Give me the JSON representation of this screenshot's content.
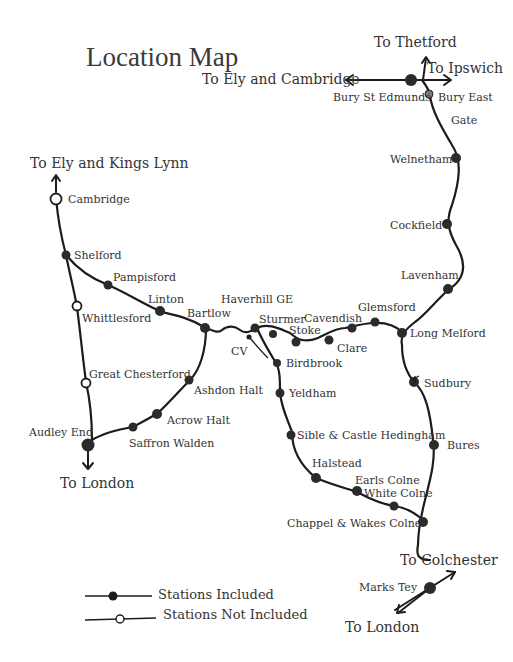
{
  "title": "Location Map",
  "colors": {
    "track": "#1c1c1c",
    "station_included": "#2b2b2b",
    "station_not_included": "#ffffff",
    "text": "#333333"
  },
  "directions": {
    "thetford": "To Thetford",
    "ipswich": "To Ipswich",
    "ely_cambridge": "To Ely and Cambridge",
    "ely_kings_lynn": "To Ely and Kings Lynn",
    "london_west": "To London",
    "colchester": "To Colchester",
    "london_east": "To London"
  },
  "stations": {
    "bury_st_edmunds": "Bury St Edmunds",
    "bury_east": "Bury East",
    "bury_east_gate": "Gate",
    "welnetham": "Welnetham",
    "cockfield": "Cockfield",
    "lavenham": "Lavenham",
    "long_melford": "Long Melford",
    "glemsford": "Glemsford",
    "cavendish": "Cavendish",
    "clare": "Clare",
    "stoke": "Stoke",
    "sturmer": "Sturmer",
    "haverhill_ge": "Haverhill GE",
    "cv": "CV",
    "birdbrook": "Birdbrook",
    "yeldham": "Yeldham",
    "sible_castle_hedingham": "Sible & Castle Hedingham",
    "halstead": "Halstead",
    "earls_colne": "Earls Colne",
    "white_colne": "White Colne",
    "chappel_wakes_colne": "Chappel & Wakes Colne",
    "marks_tey": "Marks Tey",
    "sudbury": "Sudbury",
    "bures": "Bures",
    "cambridge": "Cambridge",
    "shelford": "Shelford",
    "pampisford": "Pampisford",
    "linton": "Linton",
    "bartlow": "Bartlow",
    "whittlesford": "Whittlesford",
    "great_chesterford": "Great Chesterford",
    "audley_end": "Audley End",
    "saffron_walden": "Saffron Walden",
    "acrow_halt": "Acrow Halt",
    "ashdon_halt": "Ashdon Halt"
  },
  "legend": {
    "included": "Stations Included",
    "not_included": "Stations Not Included"
  }
}
